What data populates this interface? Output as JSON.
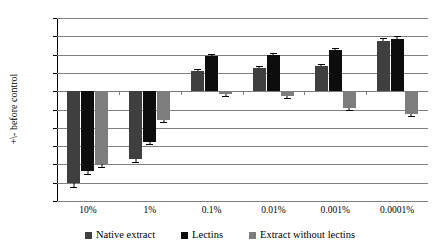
{
  "chart_data": {
    "type": "bar",
    "title": "",
    "xlabel": "",
    "ylabel": "+\\- before control",
    "categories": [
      "10%",
      "1%",
      "0.1%",
      "0.01%",
      "0.001%",
      "0.0001%"
    ],
    "ylim": [
      -120,
      80
    ],
    "ytick_step": 20,
    "yticks": [
      80,
      60,
      40,
      20,
      0,
      -20,
      -40,
      -60,
      -80,
      -100,
      -120
    ],
    "ytick_labels": [
      "80",
      "60",
      "40",
      "20",
      "0",
      "-20",
      "-40",
      "-60",
      "-80",
      "-100",
      "-120"
    ],
    "grid": true,
    "legend_position": "bottom",
    "series": [
      {
        "name": "Native extract",
        "color": "#3f3f3f",
        "values": [
          -100,
          -74,
          22,
          25,
          28,
          55
        ],
        "errors": [
          5,
          3,
          2,
          2,
          2,
          3
        ]
      },
      {
        "name": "Lectins",
        "color": "#0d0d0d",
        "values": [
          -87,
          -56,
          39,
          40,
          45,
          57
        ],
        "errors": [
          4,
          2,
          2,
          2,
          2,
          3
        ]
      },
      {
        "name": "Extract without lectins",
        "color": "#7d7d7d",
        "values": [
          -80,
          -31,
          -3,
          -5,
          -18,
          -25
        ],
        "errors": [
          3,
          2,
          1,
          1,
          2,
          2
        ]
      }
    ]
  },
  "legend": {
    "items": [
      {
        "label": "Native extract"
      },
      {
        "label": "Lectins"
      },
      {
        "label": "Extract without lectins"
      }
    ]
  }
}
